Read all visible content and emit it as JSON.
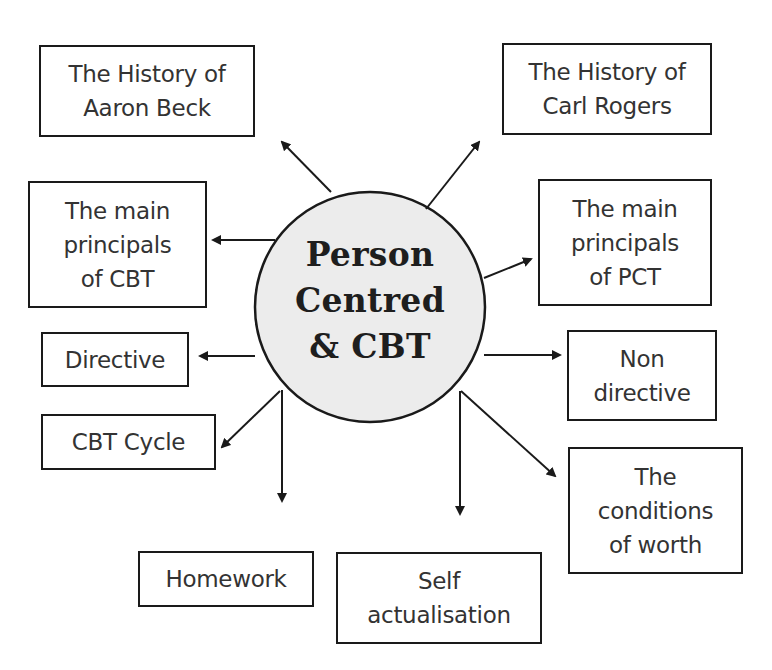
{
  "diagram": {
    "type": "mind-map",
    "center": {
      "label": "Person\nCentred\n& CBT",
      "fill": "#ececec",
      "stroke": "#1a1a1a"
    },
    "nodes": [
      {
        "id": "history-aaron-beck",
        "label": "The History of\nAaron Beck",
        "side": "left"
      },
      {
        "id": "history-carl-rogers",
        "label": "The History of\nCarl Rogers",
        "side": "right"
      },
      {
        "id": "principals-cbt",
        "label": "The main\nprincipals\nof CBT",
        "side": "left"
      },
      {
        "id": "principals-pct",
        "label": "The main\nprincipals\nof PCT",
        "side": "right"
      },
      {
        "id": "directive",
        "label": "Directive",
        "side": "left"
      },
      {
        "id": "non-directive",
        "label": "Non\ndirective",
        "side": "right"
      },
      {
        "id": "cbt-cycle",
        "label": "CBT Cycle",
        "side": "left"
      },
      {
        "id": "conditions-of-worth",
        "label": "The\nconditions\nof worth",
        "side": "right"
      },
      {
        "id": "homework",
        "label": "Homework",
        "side": "bottom"
      },
      {
        "id": "self-actualisation",
        "label": "Self\nactualisation",
        "side": "bottom"
      }
    ],
    "edges": [
      {
        "from": "center",
        "to": "history-aaron-beck"
      },
      {
        "from": "center",
        "to": "history-carl-rogers"
      },
      {
        "from": "center",
        "to": "principals-cbt"
      },
      {
        "from": "center",
        "to": "principals-pct"
      },
      {
        "from": "center",
        "to": "directive"
      },
      {
        "from": "center",
        "to": "non-directive"
      },
      {
        "from": "center",
        "to": "cbt-cycle"
      },
      {
        "from": "center",
        "to": "conditions-of-worth"
      },
      {
        "from": "center",
        "to": "homework"
      },
      {
        "from": "center",
        "to": "self-actualisation"
      }
    ],
    "colors": {
      "line": "#1a1a1a",
      "text": "#333333",
      "hub_fill": "#ececec"
    }
  }
}
